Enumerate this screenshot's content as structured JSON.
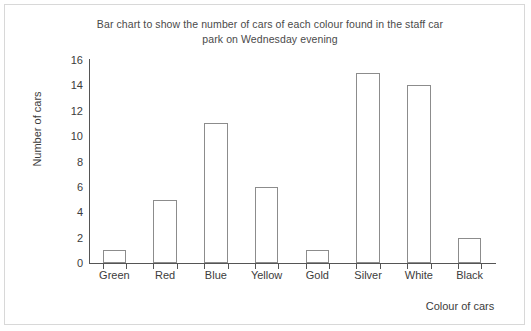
{
  "chart_data": {
    "type": "bar",
    "title": "Bar chart to show the number of cars of each colour found in the staff car park on Wednesday evening",
    "title_line1": "Bar chart to show the number of cars of each colour found in the staff car",
    "title_line2": "park on Wednesday evening",
    "categories": [
      "Green",
      "Red",
      "Blue",
      "Yellow",
      "Gold",
      "Silver",
      "White",
      "Black"
    ],
    "values": [
      1,
      5,
      11,
      6,
      1,
      15,
      14,
      2
    ],
    "xlabel": "Colour of cars",
    "ylabel": "Number of cars",
    "ylim": [
      0,
      16
    ],
    "ytick_step": 2,
    "yticks": [
      0,
      2,
      4,
      6,
      8,
      10,
      12,
      14,
      16
    ],
    "grid": false,
    "legend": false,
    "bar_fill_color": "#ffffff",
    "bar_outline_color": "#8c8c8c",
    "axis_color": "#555555",
    "text_color": "#3c3c3c",
    "title_color": "#4a4a4a",
    "background_color": "#ffffff",
    "border_color": "#d8d8d8"
  }
}
